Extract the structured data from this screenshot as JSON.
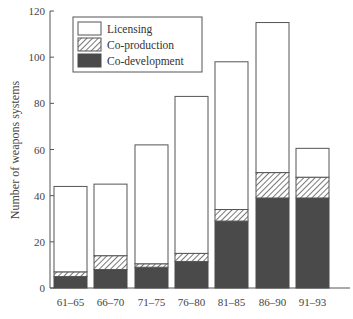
{
  "chart_data": {
    "type": "bar",
    "stacked": true,
    "title": "",
    "xlabel": "",
    "ylabel": "Number of weapons systems",
    "ylim": [
      0,
      120
    ],
    "yticks": [
      0,
      20,
      40,
      60,
      80,
      100,
      120
    ],
    "grid": false,
    "legend_position": "upper-left",
    "categories": [
      "61–65",
      "66–70",
      "71–75",
      "76–80",
      "81–85",
      "86–90",
      "91–93"
    ],
    "series": [
      {
        "name": "Co-development",
        "style": "solid-dark",
        "color": "#4a4a4a",
        "values": [
          5,
          8,
          9,
          11.5,
          29,
          39,
          39
        ]
      },
      {
        "name": "Co-production",
        "style": "hatched",
        "color": "#ffffff",
        "values": [
          2,
          6,
          1.5,
          3.5,
          5,
          11,
          9
        ]
      },
      {
        "name": "Licensing",
        "style": "white",
        "color": "#ffffff",
        "values": [
          37,
          31,
          51.5,
          68,
          64,
          65,
          12.5
        ]
      }
    ],
    "totals": [
      44,
      45,
      62,
      83,
      98,
      115,
      60.5
    ]
  },
  "legend": {
    "items": [
      {
        "label": "Licensing",
        "style": "white"
      },
      {
        "label": "Co-production",
        "style": "hatched"
      },
      {
        "label": "Co-development",
        "style": "solid-dark"
      }
    ]
  },
  "axis": {
    "y_title": "Number of weapons systems",
    "y_tick_labels": [
      "0",
      "20",
      "40",
      "60",
      "80",
      "100",
      "120"
    ],
    "x_tick_labels": [
      "61–65",
      "66–70",
      "71–75",
      "76–80",
      "81–85",
      "86–90",
      "91–93"
    ]
  }
}
